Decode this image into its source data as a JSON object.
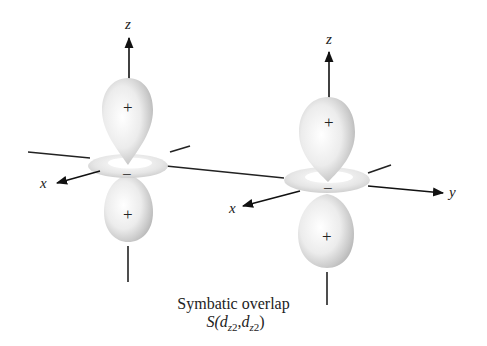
{
  "figure": {
    "caption_line1": "Symbatic overlap",
    "caption_line2": {
      "prefix": "S(",
      "arg1_base": "d",
      "arg1_sub": "z",
      "arg1_sup": "2",
      "separator": ",",
      "arg2_base": "d",
      "arg2_sub": "z",
      "arg2_sup": "2",
      "suffix": ")"
    },
    "left_orbital": {
      "axis_z_label": "z",
      "axis_x_label": "x",
      "top_lobe_sign": "+",
      "ring_sign": "−",
      "bottom_lobe_sign": "+"
    },
    "right_orbital": {
      "axis_z_label": "z",
      "axis_x_label": "x",
      "axis_y_label": "y",
      "top_lobe_sign": "+",
      "ring_sign": "−",
      "bottom_lobe_sign": "+"
    }
  }
}
